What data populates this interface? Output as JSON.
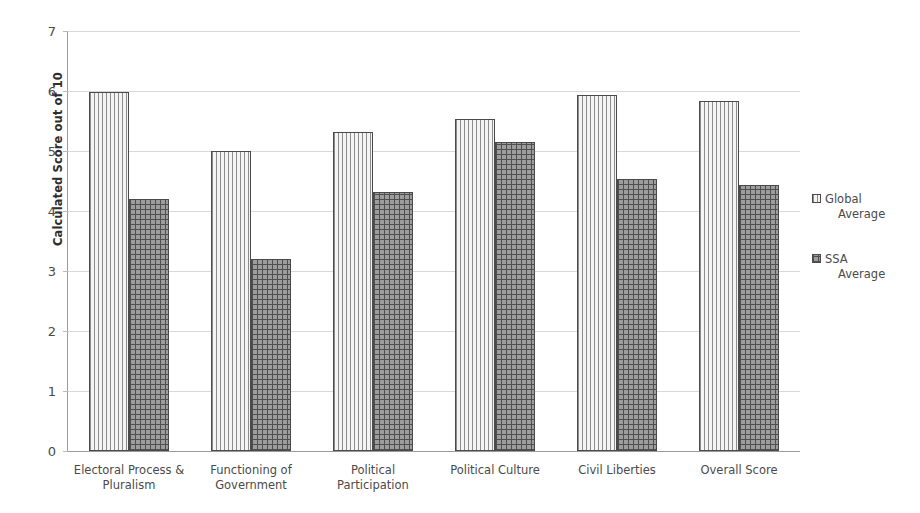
{
  "chart_data": {
    "type": "bar",
    "title": "",
    "xlabel": "",
    "ylabel": "Calculated Score out of 10",
    "ylim": [
      0,
      7
    ],
    "ytick_values": [
      0,
      1,
      2,
      3,
      4,
      5,
      6,
      7
    ],
    "ytick_labels": [
      "0",
      "1",
      "2",
      "3",
      "4",
      "5",
      "6",
      "7"
    ],
    "grid": true,
    "legend_position": "right",
    "categories": [
      "Electoral Process & Pluralism",
      "Functioning of Government",
      "Political Participation",
      "Political Culture",
      "Civil Liberties",
      "Overall Score"
    ],
    "category_lines": [
      [
        "Electoral Process &",
        "Pluralism"
      ],
      [
        "Functioning of",
        "Government"
      ],
      [
        "Political",
        "Participation"
      ],
      [
        "Political Culture",
        ""
      ],
      [
        "Civil Liberties",
        ""
      ],
      [
        "Overall Score",
        ""
      ]
    ],
    "series": [
      {
        "name": "Global Average",
        "name_lines": [
          "Global",
          "Average"
        ],
        "pattern": "vertical-stripes",
        "values": [
          5.99,
          5.0,
          5.32,
          5.53,
          5.94,
          5.84
        ]
      },
      {
        "name": "SSA Average",
        "name_lines": [
          "SSA",
          "Average"
        ],
        "pattern": "cross-hatch",
        "values": [
          4.2,
          3.2,
          4.31,
          5.15,
          4.53,
          4.44
        ]
      }
    ]
  },
  "colors": {
    "axis": "#9a9a9a",
    "gridline": "#d8d8d8",
    "text": "#4a4a4a",
    "bar_outline": "#4a4a4a",
    "series_global_fill": "#f2f2f2",
    "series_ssa_fill": "#9d9d9d",
    "background": "#ffffff"
  }
}
